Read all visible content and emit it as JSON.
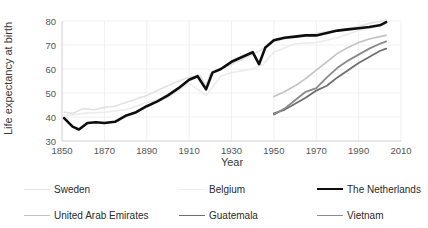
{
  "chart_data": {
    "type": "line",
    "title": "",
    "xlabel": "Year",
    "ylabel": "Life expectancy at birth",
    "xlim": [
      1850,
      2010
    ],
    "ylim": [
      30,
      80
    ],
    "xticks": [
      1850,
      1870,
      1890,
      1910,
      1930,
      1950,
      1970,
      1990,
      2010
    ],
    "yticks": [
      30,
      40,
      50,
      60,
      70,
      80
    ],
    "grid": true,
    "legend_position": "below",
    "series": [
      {
        "name": "Sweden",
        "color": "#e2e2e2",
        "width": 1.6,
        "x": [
          1851,
          1855,
          1860,
          1865,
          1870,
          1875,
          1880,
          1885,
          1890,
          1895,
          1900,
          1905,
          1910,
          1915,
          1918,
          1920,
          1925,
          1930,
          1935,
          1940,
          1945,
          1950,
          1955,
          1960,
          1965,
          1970,
          1975,
          1980,
          1985,
          1990,
          1995,
          2000,
          2003
        ],
        "y": [
          42.0,
          41.5,
          43.5,
          43.0,
          44.0,
          44.5,
          46.0,
          47.5,
          49.0,
          51.0,
          53.0,
          55.0,
          56.5,
          57.5,
          53.0,
          58.0,
          60.0,
          62.0,
          64.0,
          66.0,
          68.5,
          71.5,
          72.5,
          73.2,
          74.0,
          74.8,
          75.5,
          76.0,
          76.8,
          77.8,
          79.0,
          79.8,
          80.3
        ]
      },
      {
        "name": "Belgium",
        "color": "#ececec",
        "width": 1.6,
        "x": [
          1851,
          1860,
          1870,
          1880,
          1890,
          1900,
          1910,
          1918,
          1925,
          1930,
          1940,
          1945,
          1950,
          1960,
          1970,
          1980,
          1990,
          2000,
          2003
        ],
        "y": [
          40.5,
          41.5,
          42.0,
          43.0,
          46.0,
          48.0,
          54.0,
          49.0,
          57.0,
          58.5,
          60.0,
          62.0,
          67.0,
          70.5,
          71.0,
          73.0,
          76.0,
          78.0,
          78.5
        ]
      },
      {
        "name": "The Netherlands",
        "color": "#0d0d0d",
        "width": 2.6,
        "x": [
          1851,
          1855,
          1858,
          1862,
          1866,
          1870,
          1875,
          1880,
          1885,
          1890,
          1895,
          1900,
          1905,
          1910,
          1914,
          1918,
          1921,
          1925,
          1930,
          1935,
          1940,
          1943,
          1946,
          1950,
          1955,
          1960,
          1965,
          1970,
          1975,
          1980,
          1985,
          1990,
          1995,
          2000,
          2003
        ],
        "y": [
          39.5,
          36.0,
          34.8,
          37.5,
          37.8,
          37.5,
          38.0,
          40.5,
          42.0,
          44.5,
          46.5,
          49.0,
          52.0,
          55.5,
          57.0,
          51.5,
          58.5,
          60.0,
          63.0,
          65.0,
          67.0,
          62.0,
          69.0,
          72.0,
          73.0,
          73.5,
          74.0,
          74.0,
          75.0,
          76.0,
          76.5,
          77.0,
          77.5,
          78.2,
          79.5
        ]
      },
      {
        "name": "United Arab Emirates",
        "color": "#c2c2c2",
        "width": 1.6,
        "x": [
          1950,
          1955,
          1960,
          1965,
          1970,
          1975,
          1980,
          1985,
          1990,
          1995,
          2000,
          2003
        ],
        "y": [
          48.5,
          50.5,
          53.0,
          56.0,
          59.5,
          63.0,
          66.5,
          69.0,
          71.0,
          72.5,
          73.5,
          74.0
        ]
      },
      {
        "name": "Guatemala",
        "color": "#6e6e6e",
        "width": 1.8,
        "x": [
          1950,
          1955,
          1960,
          1965,
          1970,
          1975,
          1980,
          1985,
          1990,
          1995,
          2000,
          2003
        ],
        "y": [
          41.5,
          43.0,
          45.5,
          48.0,
          51.0,
          53.0,
          56.5,
          59.5,
          62.5,
          65.0,
          67.5,
          68.5
        ]
      },
      {
        "name": "Vietnam",
        "color": "#8a8a8a",
        "width": 1.8,
        "x": [
          1950,
          1955,
          1960,
          1965,
          1970,
          1975,
          1980,
          1985,
          1990,
          1995,
          2000,
          2003
        ],
        "y": [
          41.0,
          43.5,
          47.0,
          50.5,
          52.0,
          56.5,
          60.5,
          63.5,
          66.0,
          68.5,
          70.5,
          71.5
        ]
      }
    ]
  },
  "axis": {
    "ylabel": "Life expectancy at birth",
    "xlabel": "Year",
    "ytick_labels": [
      "30",
      "40",
      "50",
      "60",
      "70",
      "80"
    ],
    "xtick_labels": [
      "1850",
      "1870",
      "1890",
      "1910",
      "1930",
      "1950",
      "1970",
      "1990",
      "2010"
    ]
  },
  "legend": {
    "entries": [
      {
        "label": "Sweden",
        "color": "#e2e2e2",
        "width": "1.6px"
      },
      {
        "label": "Belgium",
        "color": "#ececec",
        "width": "1.6px"
      },
      {
        "label": "The Netherlands",
        "color": "#0d0d0d",
        "width": "2.8px"
      },
      {
        "label": "United Arab Emirates",
        "color": "#c2c2c2",
        "width": "1.6px"
      },
      {
        "label": "Guatemala",
        "color": "#6e6e6e",
        "width": "1.8px"
      },
      {
        "label": "Vietnam",
        "color": "#8a8a8a",
        "width": "1.8px"
      }
    ]
  },
  "style": {
    "grid_color": "#f0f0f0",
    "axis_color": "#cfcfcf",
    "background": "#ffffff"
  }
}
